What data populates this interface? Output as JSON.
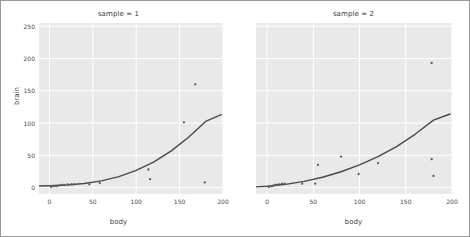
{
  "chart_data": {
    "type": "scatter",
    "title": "",
    "xlabel": "body",
    "ylabel": "brain",
    "xlim": [
      -12,
      200
    ],
    "ylim": [
      -10,
      255
    ],
    "xticks": [
      0,
      50,
      100,
      150,
      200
    ],
    "yticks": [
      0,
      50,
      100,
      150,
      200,
      250
    ],
    "xtick_labels": [
      "0",
      "50",
      "100",
      "150",
      "200"
    ],
    "ytick_labels": [
      "0",
      "50",
      "100",
      "150",
      "200",
      "250"
    ],
    "grid": true,
    "legend": "none",
    "facet_variable": "sample",
    "panel_background": "#e9e9e9",
    "grid_color": "#ffffff",
    "point_color": "#595959",
    "line_color": "#4a4a4a",
    "panels": [
      {
        "title": "sample = 1",
        "points": [
          {
            "x": 2,
            "y": 1
          },
          {
            "x": 5,
            "y": 2
          },
          {
            "x": 8,
            "y": 2
          },
          {
            "x": 11,
            "y": 3
          },
          {
            "x": 14,
            "y": 4
          },
          {
            "x": 17,
            "y": 4
          },
          {
            "x": 21,
            "y": 5
          },
          {
            "x": 25,
            "y": 5
          },
          {
            "x": 28,
            "y": 5
          },
          {
            "x": 46,
            "y": 5
          },
          {
            "x": 58,
            "y": 7
          },
          {
            "x": 114,
            "y": 28
          },
          {
            "x": 116,
            "y": 13
          },
          {
            "x": 155,
            "y": 101
          },
          {
            "x": 168,
            "y": 160
          },
          {
            "x": 179,
            "y": 8
          }
        ],
        "fit_curve": [
          {
            "x": -12,
            "y": 2.4
          },
          {
            "x": 0,
            "y": 2.8
          },
          {
            "x": 20,
            "y": 3.9
          },
          {
            "x": 40,
            "y": 6.2
          },
          {
            "x": 60,
            "y": 10.4
          },
          {
            "x": 80,
            "y": 17.0
          },
          {
            "x": 100,
            "y": 26.5
          },
          {
            "x": 120,
            "y": 39.5
          },
          {
            "x": 140,
            "y": 56.5
          },
          {
            "x": 160,
            "y": 77.5
          },
          {
            "x": 180,
            "y": 102.5
          },
          {
            "x": 198,
            "y": 113.0
          }
        ]
      },
      {
        "title": "sample = 2",
        "points": [
          {
            "x": 2,
            "y": 1
          },
          {
            "x": 5,
            "y": 2
          },
          {
            "x": 7,
            "y": 3
          },
          {
            "x": 9,
            "y": 4
          },
          {
            "x": 11,
            "y": 4
          },
          {
            "x": 13,
            "y": 5
          },
          {
            "x": 16,
            "y": 6
          },
          {
            "x": 19,
            "y": 6
          },
          {
            "x": 38,
            "y": 6
          },
          {
            "x": 52,
            "y": 6
          },
          {
            "x": 55,
            "y": 35
          },
          {
            "x": 80,
            "y": 48
          },
          {
            "x": 99,
            "y": 21
          },
          {
            "x": 120,
            "y": 38
          },
          {
            "x": 178,
            "y": 44
          },
          {
            "x": 180,
            "y": 18
          },
          {
            "x": 178,
            "y": 193
          }
        ],
        "fit_curve": [
          {
            "x": -12,
            "y": 1.0
          },
          {
            "x": 0,
            "y": 2.0
          },
          {
            "x": 20,
            "y": 5.0
          },
          {
            "x": 40,
            "y": 9.5
          },
          {
            "x": 60,
            "y": 16.0
          },
          {
            "x": 80,
            "y": 24.5
          },
          {
            "x": 100,
            "y": 35.0
          },
          {
            "x": 120,
            "y": 48.0
          },
          {
            "x": 140,
            "y": 63.5
          },
          {
            "x": 160,
            "y": 82.5
          },
          {
            "x": 180,
            "y": 104.5
          },
          {
            "x": 198,
            "y": 114.0
          }
        ]
      }
    ]
  }
}
